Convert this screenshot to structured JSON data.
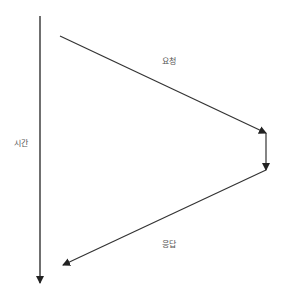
{
  "diagram": {
    "type": "sequence-timeline",
    "labels": {
      "time": "시간",
      "request": "요청",
      "response": "응답"
    },
    "colors": {
      "line": "#333333",
      "text": "#555555",
      "background": "#ffffff"
    },
    "edges": [
      {
        "name": "time-axis",
        "from": [
          40,
          16
        ],
        "to": [
          40,
          283
        ]
      },
      {
        "name": "request-arrow",
        "from": [
          60,
          36
        ],
        "to": [
          266,
          133
        ]
      },
      {
        "name": "processing-arrow",
        "from": [
          266,
          133
        ],
        "to": [
          266,
          170
        ]
      },
      {
        "name": "response-arrow",
        "from": [
          266,
          170
        ],
        "to": [
          63,
          265
        ]
      }
    ]
  }
}
